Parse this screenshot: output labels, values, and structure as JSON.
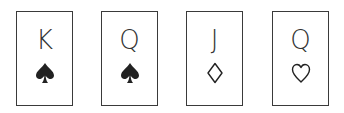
{
  "cards": [
    {
      "rank": "K",
      "suit": "spade",
      "filled": true
    },
    {
      "rank": "Q",
      "suit": "spade",
      "filled": true
    },
    {
      "rank": "J",
      "suit": "diamond",
      "filled": false
    },
    {
      "rank": "Q",
      "suit": "heart",
      "filled": false
    }
  ],
  "colors": {
    "ink": "#222222",
    "border": "#3a3a3a",
    "background": "#ffffff"
  }
}
